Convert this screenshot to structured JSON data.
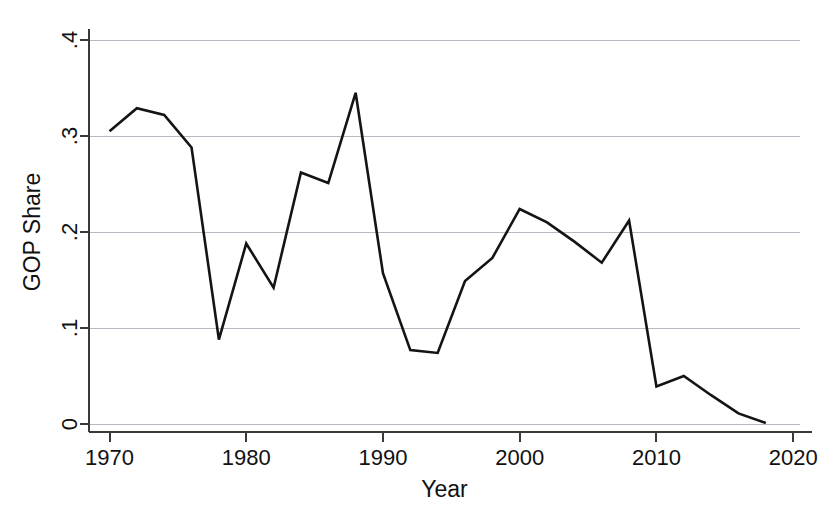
{
  "figure": {
    "background_color": "#ffffff",
    "width": 840,
    "height": 522
  },
  "chart_data": {
    "type": "line",
    "title": "",
    "subtitle": "",
    "xlabel": "Year",
    "ylabel": "GOP Share",
    "xlim": [
      1968.5,
      2020.5
    ],
    "ylim": [
      0,
      0.4
    ],
    "grid": "horizontal",
    "legend": "none",
    "line_color": "#141414",
    "grid_color": "#b9b9c2",
    "axis_color": "#3a3a3a",
    "xticks": [
      1970,
      1980,
      1990,
      2000,
      2010,
      2020
    ],
    "xtick_labels": [
      "1970",
      "1980",
      "1990",
      "2000",
      "2010",
      "2020"
    ],
    "yticks": [
      0,
      0.1,
      0.2,
      0.3,
      0.4
    ],
    "ytick_labels": [
      "0",
      ".1",
      ".2",
      ".3",
      ".4"
    ],
    "x": [
      1970,
      1972,
      1974,
      1976,
      1978,
      1980,
      1982,
      1984,
      1986,
      1988,
      1990,
      1992,
      1994,
      1996,
      1998,
      2000,
      2002,
      2004,
      2006,
      2008,
      2010,
      2012,
      2014,
      2016,
      2018
    ],
    "series": [
      {
        "name": "GOP Share",
        "values": [
          0.305,
          0.329,
          0.322,
          0.288,
          0.088,
          0.188,
          0.142,
          0.262,
          0.251,
          0.345,
          0.157,
          0.077,
          0.074,
          0.149,
          0.173,
          0.224,
          0.21,
          0.19,
          0.168,
          0.212,
          0.039,
          0.05,
          0.03,
          0.011,
          0.001
        ]
      }
    ]
  }
}
